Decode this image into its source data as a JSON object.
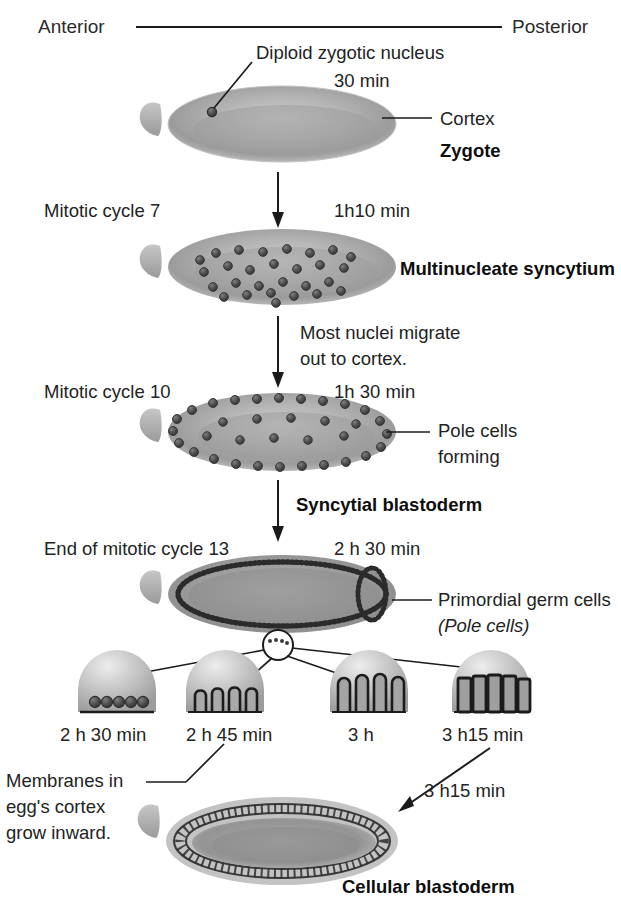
{
  "figure": {
    "axis": {
      "anterior_label": "Anterior",
      "posterior_label": "Posterior"
    },
    "palette": {
      "embryo_light": "#d9d9d9",
      "embryo_mid": "#b9b9b9",
      "embryo_dark": "#8f8f8f",
      "nucleus": "#4a4a4a",
      "line": "#1b1b1b",
      "text": "#232323",
      "background": "#ffffff"
    }
  },
  "stages": [
    {
      "id": "zygote",
      "cycle_label": "",
      "time_label": "30 min",
      "stage_name": "Zygote",
      "callouts": [
        {
          "name": "diploid-zygotic-nucleus",
          "text": "Diploid zygotic nucleus"
        },
        {
          "name": "cortex",
          "text": "Cortex"
        }
      ],
      "nuclei_count": 1
    },
    {
      "id": "multinucleate-syncytium",
      "cycle_label": "Mitotic cycle 7",
      "time_label": "1h10 min",
      "stage_name": "Multinucleate syncytium",
      "callouts": [],
      "nuclei_count": 28,
      "transition_note": "Most nuclei migrate\nout to cortex."
    },
    {
      "id": "syncytial-blastoderm",
      "cycle_label": "Mitotic cycle 10",
      "time_label": "1h 30 min",
      "stage_name": "Syncytial blastoderm",
      "callouts": [
        {
          "name": "pole-cells-forming",
          "text": "Pole cells\nforming"
        }
      ],
      "nuclei_count": 46
    },
    {
      "id": "primordial-germ-cells",
      "cycle_label": "End of mitotic cycle 13",
      "time_label": "2 h 30 min",
      "stage_name": "",
      "callouts": [
        {
          "name": "primordial-germ-cells",
          "text": "Primordial germ cells"
        },
        {
          "name": "pole-cells-italic",
          "text": "(Pole cells)"
        }
      ]
    },
    {
      "id": "cellular-blastoderm",
      "cycle_label": "",
      "time_label": "3 h15 min",
      "stage_name": "Cellular blastoderm",
      "callouts": [
        {
          "name": "membranes-grow-inward",
          "text": "Membranes in\negg's cortex\ngrow inward."
        }
      ]
    }
  ],
  "detail_panels": {
    "caption": "Cellularization sequence at the egg cortex",
    "items": [
      {
        "id": "panel-1",
        "time_label": "2 h 30 min",
        "furrow_depth": 0,
        "nuclei": 5
      },
      {
        "id": "panel-2",
        "time_label": "2 h 45 min",
        "furrow_depth": 1,
        "nuclei": 5
      },
      {
        "id": "panel-3",
        "time_label": "3 h",
        "furrow_depth": 2,
        "nuclei": 5
      },
      {
        "id": "panel-4",
        "time_label": "3 h15 min",
        "furrow_depth": 3,
        "nuclei": 5
      }
    ]
  },
  "transition_texts": {
    "migrate_line1": "Most nuclei migrate",
    "migrate_line2": "out to cortex."
  },
  "membrane_caption": {
    "line1": "Membranes in",
    "line2": "egg's cortex",
    "line3": "grow inward."
  },
  "pole_caption": {
    "line1": "Primordial germ cells",
    "line2": "(Pole cells)"
  },
  "pole_forming": {
    "line1": "Pole cells",
    "line2": "forming"
  }
}
